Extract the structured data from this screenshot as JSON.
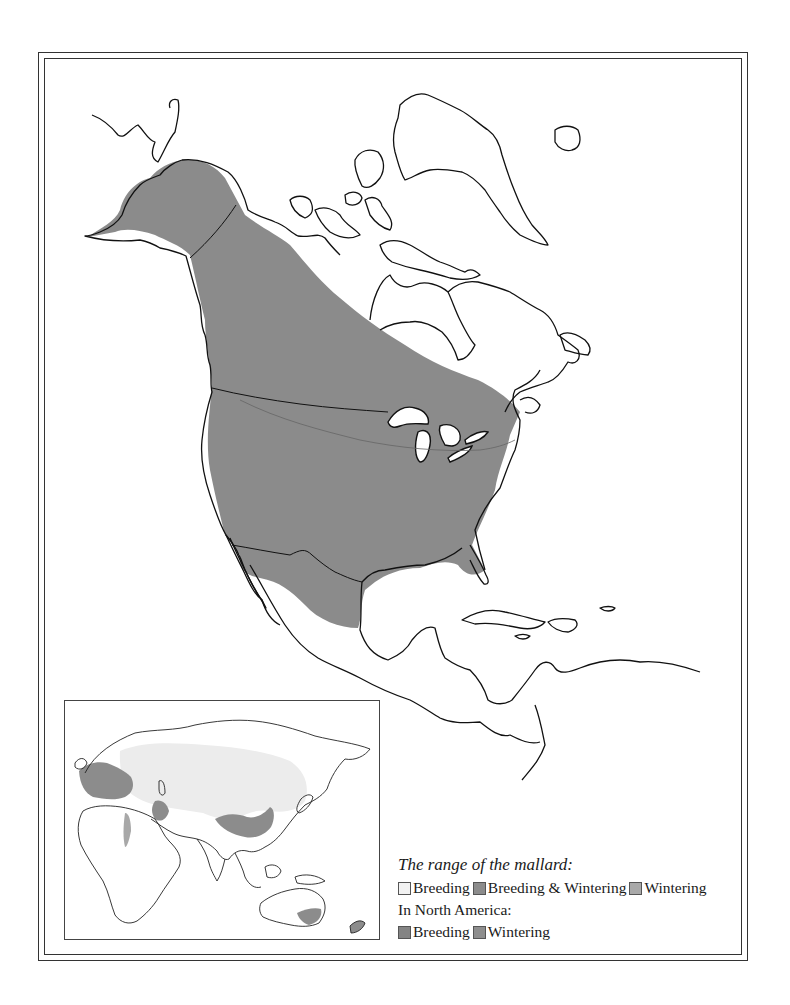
{
  "map": {
    "title": "The range of the mallard",
    "colors": {
      "land": "#ffffff",
      "coastline": "#111111",
      "na_breeding": "#8a8a8a",
      "na_wintering": "#8f8f8f",
      "eurasia_breeding": "#ececec",
      "eurasia_breeding_wintering": "#8c8c8c",
      "eurasia_wintering": "#a6a6a6"
    },
    "regions": [
      "North America",
      "Greenland",
      "Central America",
      "Caribbean",
      "Eurasia",
      "Africa",
      "Australia",
      "New Zealand"
    ]
  },
  "legend": {
    "title": "The range of the mallard:",
    "items": [
      {
        "label": "Breeding",
        "color": "#f2f2f2"
      },
      {
        "label": "Breeding & Wintering",
        "color": "#8c8c8c"
      },
      {
        "label": "Wintering",
        "color": "#a9a9a9"
      }
    ],
    "subtitle": "In North America:",
    "na_items": [
      {
        "label": "Breeding",
        "color": "#848484"
      },
      {
        "label": "Wintering",
        "color": "#8e8e8e"
      }
    ]
  }
}
